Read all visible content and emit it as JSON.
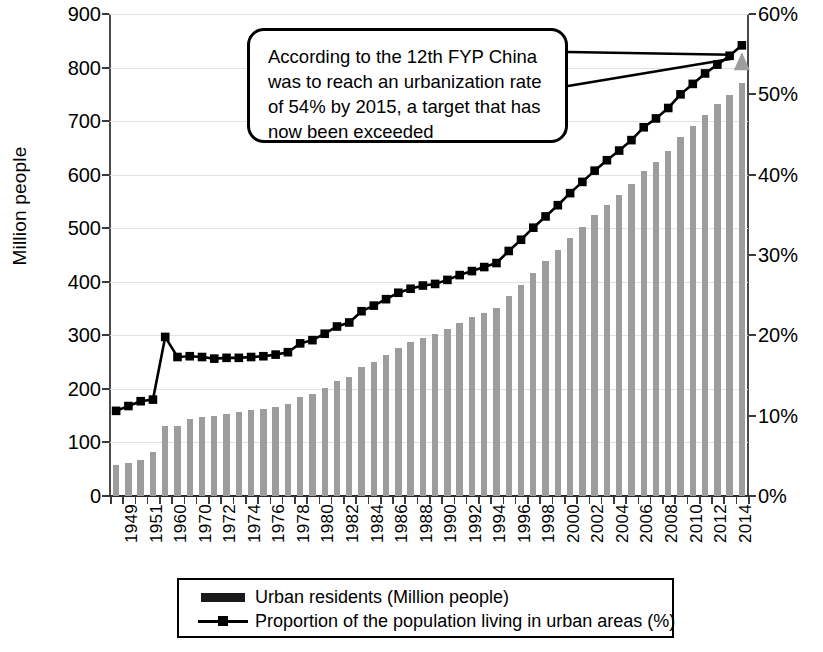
{
  "chart_data": {
    "type": "bar",
    "title": "",
    "subtitle": "",
    "xlabel": "",
    "ylabel": "Million people",
    "y2label": "",
    "ylim": [
      0,
      900
    ],
    "yticks": [
      "0",
      "100",
      "200",
      "300",
      "400",
      "500",
      "600",
      "700",
      "800",
      "900"
    ],
    "y2lim": [
      0,
      60
    ],
    "y2ticks": [
      "0%",
      "10%",
      "20%",
      "30%",
      "40%",
      "50%",
      "60%"
    ],
    "grid": true,
    "legend_position": "bottom",
    "categories": [
      "1949",
      "1950",
      "1951",
      "1952",
      "1960",
      "1962",
      "1970",
      "1971",
      "1972",
      "1973",
      "1974",
      "1975",
      "1976",
      "1977",
      "1978",
      "1979",
      "1980",
      "1981",
      "1982",
      "1983",
      "1984",
      "1985",
      "1986",
      "1987",
      "1988",
      "1989",
      "1990",
      "1991",
      "1992",
      "1993",
      "1994",
      "1995",
      "1996",
      "1997",
      "1998",
      "1999",
      "2000",
      "2001",
      "2002",
      "2003",
      "2004",
      "2005",
      "2006",
      "2007",
      "2008",
      "2009",
      "2010",
      "2011",
      "2012",
      "2013",
      "2014",
      "2015"
    ],
    "tick_labels": [
      "1949",
      "",
      "1951",
      "",
      "1960",
      "",
      "1970",
      "",
      "1972",
      "",
      "1974",
      "",
      "1976",
      "",
      "1978",
      "",
      "1980",
      "",
      "1982",
      "",
      "1984",
      "",
      "1986",
      "",
      "1988",
      "",
      "1990",
      "",
      "1992",
      "",
      "1994",
      "",
      "1996",
      "",
      "1998",
      "",
      "2000",
      "",
      "2002",
      "",
      "2004",
      "",
      "2006",
      "",
      "2008",
      "",
      "2010",
      "",
      "2012",
      "",
      "2014",
      ""
    ],
    "series": [
      {
        "name": "Urban residents (Million people)",
        "type": "bar",
        "axis": "left",
        "unit": "Million people",
        "color": "#9d9d9d",
        "values": [
          57,
          62,
          67,
          83,
          130,
          130,
          144,
          147,
          150,
          154,
          156,
          160,
          163,
          166,
          172,
          185,
          191,
          201,
          215,
          222,
          240,
          251,
          264,
          277,
          287,
          295,
          302,
          312,
          323,
          334,
          342,
          352,
          373,
          394,
          416,
          438,
          459,
          481,
          502,
          524,
          543,
          562,
          583,
          607,
          624,
          645,
          670,
          691,
          712,
          732,
          749,
          771
        ]
      },
      {
        "name": "Proportion of the population living in urban areas (%)",
        "type": "line",
        "axis": "right",
        "unit": "%",
        "color": "#000000",
        "values": [
          10.6,
          11.2,
          11.8,
          12.0,
          19.8,
          17.3,
          17.4,
          17.3,
          17.1,
          17.2,
          17.2,
          17.3,
          17.4,
          17.6,
          17.9,
          19.0,
          19.4,
          20.2,
          21.1,
          21.6,
          23.0,
          23.7,
          24.5,
          25.3,
          25.8,
          26.2,
          26.4,
          26.9,
          27.5,
          28.0,
          28.5,
          29.0,
          30.5,
          31.9,
          33.4,
          34.8,
          36.2,
          37.7,
          39.1,
          40.5,
          41.8,
          43.0,
          44.3,
          45.9,
          47.0,
          48.3,
          50.0,
          51.3,
          52.6,
          53.7,
          54.8,
          56.1
        ]
      }
    ],
    "target_marker": {
      "name": "urbanization-target-marker",
      "shape": "triangle",
      "color": "#9d9d9d",
      "category": "2015",
      "value": 54
    },
    "annotation": {
      "text": "According to the 12th FYP China\nwas to reach an urbanization rate\nof 54% by 2015, a target that has\nnow been exceeded"
    }
  },
  "legend": {
    "items": [
      {
        "label": "Urban residents (Million people)",
        "marker": "filled-bar-swatch"
      },
      {
        "label": "Proportion of the population living in urban areas (%)",
        "marker": "line-with-square-marker"
      }
    ]
  },
  "colors": {
    "bar": "#9d9d9d",
    "line": "#000000",
    "grid": "#e2e2e2",
    "axis": "#3a3a3a",
    "background": "#ffffff"
  }
}
